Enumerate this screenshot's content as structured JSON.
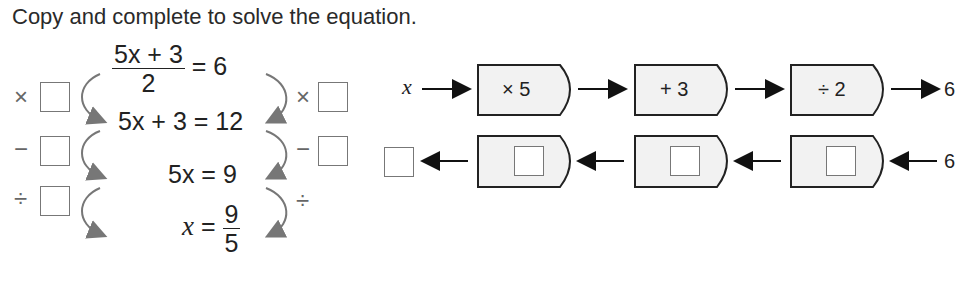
{
  "instruction": "Copy and complete to solve the equation.",
  "equation_steps": {
    "step1": {
      "numerator": "5x + 3",
      "denominator": "2",
      "rhs": "= 6"
    },
    "step2": "5x + 3 = 12",
    "step3_lhs": "5x",
    "step3_rhs": "= 9",
    "step4": {
      "lhs": "x",
      "eq": "=",
      "numerator": "9",
      "denominator": "5"
    }
  },
  "left_operations": [
    "×",
    "−",
    "÷"
  ],
  "right_operations": [
    "×",
    "−",
    "÷"
  ],
  "function_machine": {
    "forward": {
      "input": "x",
      "operations": [
        "× 5",
        "+ 3",
        "÷ 2"
      ],
      "output": "6"
    },
    "inverse": {
      "input": "6",
      "operations": [
        "",
        "",
        ""
      ],
      "output": ""
    }
  },
  "colors": {
    "text": "#222222",
    "arrow": "#777777",
    "box_fill": "#f2f2f2",
    "box_border": "#222222"
  }
}
